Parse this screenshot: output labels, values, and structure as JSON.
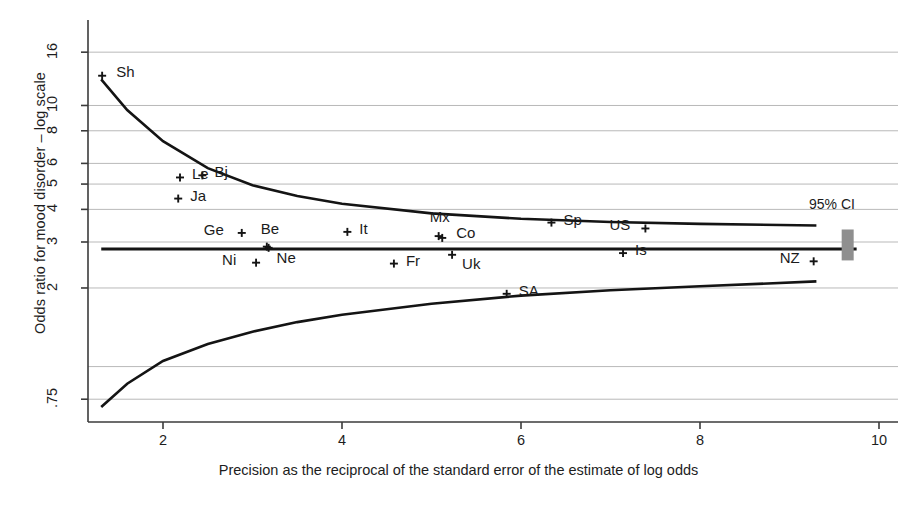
{
  "figure": {
    "ylabel": "Odds ratio for mood disorder – log scale",
    "xlabel": "Precision as the reciprocal of the standard error of the estimate of log odds",
    "ci_annotation": "95% CI"
  },
  "chart_data": {
    "type": "scatter",
    "title": "",
    "subtitle": "",
    "xlabel": "Precision as the reciprocal of the standard error of the estimate of log odds",
    "ylabel": "Odds ratio for mood disorder – log scale",
    "yscale": "log",
    "xlim": [
      1.25,
      10.1
    ],
    "ylim": [
      0.68,
      17.5
    ],
    "xticks": [
      2,
      4,
      6,
      8,
      10
    ],
    "xtick_labels": [
      "2",
      "4",
      "6",
      "8",
      "10"
    ],
    "yticks": [
      16,
      10,
      8,
      6,
      5,
      4,
      3,
      2,
      0.75
    ],
    "ytick_labels": [
      "16",
      "10",
      "8",
      "6",
      "5",
      "4",
      "3",
      "2",
      ".75"
    ],
    "grid": true,
    "gridlines_y": [
      16,
      10,
      8,
      6,
      5,
      4,
      3,
      2,
      1,
      0.75
    ],
    "legend": "none",
    "pooled_estimate": 2.82,
    "pooled_line_label": "pooled odds ratio",
    "ci_band_label": "95% CI",
    "ci_band_x": 9.65,
    "ci_band_low": 2.55,
    "ci_band_high": 3.35,
    "funnel_upper": [
      {
        "x": 1.31,
        "y": 12.6
      },
      {
        "x": 1.6,
        "y": 9.6
      },
      {
        "x": 2.0,
        "y": 7.3
      },
      {
        "x": 2.5,
        "y": 5.75
      },
      {
        "x": 3.0,
        "y": 4.95
      },
      {
        "x": 3.5,
        "y": 4.5
      },
      {
        "x": 4.0,
        "y": 4.2
      },
      {
        "x": 5.0,
        "y": 3.86
      },
      {
        "x": 6.0,
        "y": 3.68
      },
      {
        "x": 7.0,
        "y": 3.58
      },
      {
        "x": 8.0,
        "y": 3.52
      },
      {
        "x": 9.3,
        "y": 3.47
      }
    ],
    "funnel_lower": [
      {
        "x": 1.31,
        "y": 0.7
      },
      {
        "x": 1.6,
        "y": 0.86
      },
      {
        "x": 2.0,
        "y": 1.05
      },
      {
        "x": 2.5,
        "y": 1.22
      },
      {
        "x": 3.0,
        "y": 1.36
      },
      {
        "x": 3.5,
        "y": 1.48
      },
      {
        "x": 4.0,
        "y": 1.58
      },
      {
        "x": 5.0,
        "y": 1.74
      },
      {
        "x": 6.0,
        "y": 1.87
      },
      {
        "x": 7.0,
        "y": 1.96
      },
      {
        "x": 8.0,
        "y": 2.03
      },
      {
        "x": 9.3,
        "y": 2.12
      }
    ],
    "points": [
      {
        "label": "Sh",
        "x": 1.32,
        "y": 13.0,
        "lx": 14,
        "ly": -5
      },
      {
        "label": "Le",
        "x": 2.19,
        "y": 5.3,
        "lx": 12,
        "ly": -4
      },
      {
        "label": "Bj",
        "x": 2.44,
        "y": 5.4,
        "lx": 12,
        "ly": -4
      },
      {
        "label": "Ja",
        "x": 2.17,
        "y": 4.4,
        "lx": 12,
        "ly": -4
      },
      {
        "label": "Ge",
        "x": 2.88,
        "y": 3.25,
        "lx": -38,
        "ly": -4
      },
      {
        "label": "Be",
        "x": 3.16,
        "y": 2.88,
        "lx": -6,
        "ly": -19
      },
      {
        "label": "Ne",
        "x": 3.18,
        "y": 2.85,
        "lx": 8,
        "ly": 9
      },
      {
        "label": "Ni",
        "x": 3.04,
        "y": 2.5,
        "lx": -34,
        "ly": -4
      },
      {
        "label": "It",
        "x": 4.06,
        "y": 3.28,
        "lx": 12,
        "ly": -4
      },
      {
        "label": "Fr",
        "x": 4.58,
        "y": 2.48,
        "lx": 12,
        "ly": -4
      },
      {
        "label": "Mx",
        "x": 5.08,
        "y": 3.16,
        "lx": -9,
        "ly": -20
      },
      {
        "label": "Co",
        "x": 5.12,
        "y": 3.11,
        "lx": 14,
        "ly": -6
      },
      {
        "label": "Uk",
        "x": 5.23,
        "y": 2.68,
        "lx": 10,
        "ly": 8
      },
      {
        "label": "SA",
        "x": 5.84,
        "y": 1.9,
        "lx": 12,
        "ly": -4
      },
      {
        "label": "Sp",
        "x": 6.34,
        "y": 3.56,
        "lx": 12,
        "ly": -4
      },
      {
        "label": "US",
        "x": 7.39,
        "y": 3.38,
        "lx": -36,
        "ly": -4
      },
      {
        "label": "Is",
        "x": 7.14,
        "y": 2.72,
        "lx": 12,
        "ly": -4
      },
      {
        "label": "NZ",
        "x": 9.27,
        "y": 2.53,
        "lx": -34,
        "ly": -4
      }
    ]
  },
  "colors": {
    "axis": "#3b3b3b",
    "grid": "#b9b9b9",
    "curve": "#141414",
    "marker": "#141414",
    "ci_bar": "#8f8f8f",
    "text": "#1d1d1d"
  }
}
